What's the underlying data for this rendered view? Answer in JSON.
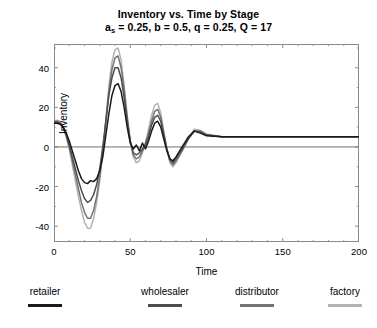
{
  "chart_data": {
    "type": "line",
    "title": "Inventory vs. Time by Stage",
    "subtitle_prefix": "a",
    "subtitle_sub": "s",
    "subtitle_rest": " = 0.25, b = 0.5, q = 0.25, Q = 17",
    "subtitle_full": "a_s = 0.25, b = 0.5, q = 0.25, Q = 17",
    "xlabel": "Time",
    "ylabel": "Inventory",
    "xlim": [
      0,
      200
    ],
    "ylim": [
      -48,
      52
    ],
    "xticks": [
      0,
      50,
      100,
      150,
      200
    ],
    "yticks": [
      40,
      20,
      0,
      -20,
      -40
    ],
    "xtick_labels": [
      "0",
      "50",
      "100",
      "150",
      "200"
    ],
    "ytick_labels": [
      "40",
      "20",
      "0",
      "-20",
      "-40"
    ],
    "grid": false,
    "legend_position": "below",
    "zero_line": 0,
    "steady_state": 5.2,
    "series": [
      {
        "name": "retailer",
        "color": "#1a1a1a",
        "x": [
          0,
          2,
          4,
          6,
          8,
          10,
          12,
          14,
          16,
          18,
          20,
          22,
          24,
          26,
          28,
          30,
          32,
          34,
          36,
          38,
          40,
          42,
          44,
          46,
          48,
          50,
          52,
          54,
          56,
          58,
          60,
          62,
          64,
          66,
          68,
          70,
          72,
          74,
          76,
          78,
          80,
          84,
          88,
          92,
          96,
          100,
          110,
          120,
          140,
          160,
          180,
          200
        ],
        "y": [
          12,
          12,
          11.5,
          10,
          7,
          3,
          -2,
          -7,
          -12,
          -16,
          -18,
          -18.5,
          -17,
          -17.5,
          -16,
          -12,
          -5,
          6,
          17,
          26,
          31,
          32,
          28,
          20,
          10,
          2,
          -1,
          1,
          -2,
          2,
          -1,
          3,
          8,
          12,
          13,
          10,
          4,
          -2,
          -6,
          -7,
          -5,
          0,
          5,
          8,
          7,
          5.6,
          5.2,
          5.2,
          5.2,
          5.2,
          5.2,
          5.2
        ]
      },
      {
        "name": "wholesaler",
        "color": "#4d4d4d",
        "x": [
          0,
          2,
          4,
          6,
          8,
          10,
          12,
          14,
          16,
          18,
          20,
          22,
          24,
          26,
          28,
          30,
          32,
          34,
          36,
          38,
          40,
          42,
          44,
          46,
          48,
          50,
          52,
          54,
          56,
          58,
          60,
          62,
          64,
          66,
          68,
          70,
          72,
          74,
          76,
          78,
          80,
          84,
          88,
          92,
          96,
          100,
          110,
          120,
          140,
          160,
          180,
          200
        ],
        "y": [
          12.5,
          12.5,
          12,
          10,
          6,
          1,
          -5,
          -11,
          -17,
          -22,
          -26,
          -28,
          -27,
          -24,
          -19,
          -11,
          0,
          13,
          26,
          35,
          40,
          40,
          35,
          25,
          13,
          3,
          -3,
          -4,
          -3,
          -1,
          1,
          5,
          11,
          15,
          16,
          13,
          6,
          -1,
          -6,
          -8,
          -6,
          -1,
          4,
          8,
          7.5,
          6,
          5.2,
          5.2,
          5.2,
          5.2,
          5.2,
          5.2
        ]
      },
      {
        "name": "distributor",
        "color": "#737373",
        "x": [
          0,
          2,
          4,
          6,
          8,
          10,
          12,
          14,
          16,
          18,
          20,
          22,
          24,
          26,
          28,
          30,
          32,
          34,
          36,
          38,
          40,
          42,
          44,
          46,
          48,
          50,
          52,
          54,
          56,
          58,
          60,
          62,
          64,
          66,
          68,
          70,
          72,
          74,
          76,
          78,
          80,
          84,
          88,
          92,
          96,
          100,
          110,
          120,
          140,
          160,
          180,
          200
        ],
        "y": [
          13,
          13,
          12.5,
          10,
          6,
          0,
          -7,
          -14,
          -21,
          -28,
          -33,
          -36,
          -36,
          -32,
          -25,
          -15,
          -2,
          13,
          28,
          39,
          45,
          46,
          40,
          29,
          15,
          3,
          -4,
          -6,
          -5,
          -2,
          2,
          7,
          13,
          18,
          19,
          15,
          7,
          -1,
          -7,
          -9,
          -7,
          -2,
          4,
          8,
          8,
          6.2,
          5.2,
          5.2,
          5.2,
          5.2,
          5.2,
          5.2
        ]
      },
      {
        "name": "factory",
        "color": "#b3b3b3",
        "x": [
          0,
          2,
          4,
          6,
          8,
          10,
          12,
          14,
          16,
          18,
          20,
          22,
          24,
          26,
          28,
          30,
          32,
          34,
          36,
          38,
          40,
          42,
          44,
          46,
          48,
          50,
          52,
          54,
          56,
          58,
          60,
          62,
          64,
          66,
          68,
          70,
          72,
          74,
          76,
          78,
          80,
          84,
          88,
          92,
          96,
          100,
          110,
          120,
          140,
          160,
          180,
          200
        ],
        "y": [
          13.5,
          13.5,
          13,
          10,
          5,
          -1,
          -9,
          -17,
          -25,
          -32,
          -38,
          -41,
          -41,
          -36,
          -28,
          -17,
          -3,
          14,
          31,
          43,
          49,
          50,
          44,
          31,
          16,
          3,
          -5,
          -8,
          -7,
          -3,
          2,
          9,
          16,
          21,
          22,
          17,
          8,
          -1,
          -8,
          -10,
          -8,
          -2,
          4,
          9,
          8.5,
          6.5,
          5.2,
          5.2,
          5.2,
          5.2,
          5.2,
          5.2
        ]
      }
    ]
  },
  "legend": {
    "entries": [
      {
        "label": "retailer",
        "color": "#1a1a1a"
      },
      {
        "label": "wholesaler",
        "color": "#4d4d4d"
      },
      {
        "label": "distributor",
        "color": "#737373"
      },
      {
        "label": "factory",
        "color": "#b3b3b3"
      }
    ]
  },
  "colors": {
    "frame": "#8a8a8a",
    "axis_zero": "#6e6e6e",
    "background": "#ffffff",
    "text": "#000000"
  }
}
